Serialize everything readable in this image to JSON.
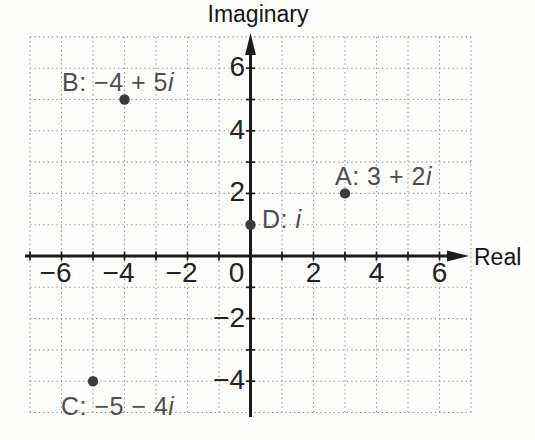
{
  "figure_colors": {
    "background": "#fdfdfc",
    "grid": "#8f8f8f",
    "axis": "#1b1b1b",
    "tick_text": "#232323",
    "point_dot": "#3c3c3c",
    "point_label_text": "#4e4e4e"
  },
  "chart_data": {
    "type": "scatter",
    "title": "",
    "xlabel": "Real",
    "ylabel": "Imaginary",
    "xlim": [
      -7,
      7
    ],
    "ylim": [
      -5,
      7
    ],
    "grid": true,
    "grid_style": "dotted",
    "x_ticks": [
      {
        "value": -6,
        "label": "−6"
      },
      {
        "value": -4,
        "label": "−4"
      },
      {
        "value": -2,
        "label": "−2"
      },
      {
        "value": 0,
        "label": "0"
      },
      {
        "value": 2,
        "label": "2"
      },
      {
        "value": 4,
        "label": "4"
      },
      {
        "value": 6,
        "label": "6"
      }
    ],
    "y_ticks": [
      {
        "value": 6,
        "label": "6"
      },
      {
        "value": 4,
        "label": "4"
      },
      {
        "value": 2,
        "label": "2"
      },
      {
        "value": -2,
        "label": "−2"
      },
      {
        "value": -4,
        "label": "−4"
      }
    ],
    "points": [
      {
        "name": "A",
        "re": 3,
        "im": 2,
        "label_prefix": "A: 3 + 2",
        "label_italic": "i"
      },
      {
        "name": "B",
        "re": -4,
        "im": 5,
        "label_prefix": "B: −4 + 5",
        "label_italic": "i"
      },
      {
        "name": "C",
        "re": -5,
        "im": -4,
        "label_prefix": "C: −5 − 4",
        "label_italic": "i"
      },
      {
        "name": "D",
        "re": 0,
        "im": 1,
        "label_prefix": "D: ",
        "label_italic": "i"
      }
    ]
  }
}
